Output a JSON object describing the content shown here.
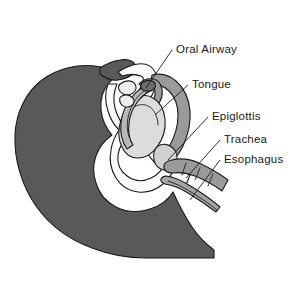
{
  "figure": {
    "background_color": "#ffffff",
    "width": 300,
    "height": 288
  },
  "palette": {
    "head_silhouette": "#595959",
    "mid_tissue": "#9a9a9a",
    "light_tissue": "#d4d4d4",
    "pale_tissue": "#e8e8e8",
    "white_tissue": "#f7f7f7",
    "outline": "#1a1a1a",
    "label_text": "#1a1a1a"
  },
  "labels": [
    {
      "id": "oral-airway",
      "text": "Oral Airway",
      "x": 176,
      "y": 53,
      "leader": {
        "x1": 172,
        "y1": 50,
        "x2": 146,
        "y2": 88
      }
    },
    {
      "id": "tongue",
      "text": "Tongue",
      "x": 192,
      "y": 88,
      "leader": {
        "x1": 188,
        "y1": 85,
        "x2": 155,
        "y2": 115
      }
    },
    {
      "id": "epiglottis",
      "text": "Epiglottis",
      "x": 212,
      "y": 120,
      "leader": {
        "x1": 208,
        "y1": 117,
        "x2": 168,
        "y2": 160
      }
    },
    {
      "id": "trachea",
      "text": "Trachea",
      "x": 224,
      "y": 143,
      "leader": {
        "x1": 220,
        "y1": 140,
        "x2": 186,
        "y2": 178
      }
    },
    {
      "id": "esophagus",
      "text": "Esophagus",
      "x": 224,
      "y": 163,
      "leader": {
        "x1": 220,
        "y1": 160,
        "x2": 190,
        "y2": 200
      }
    }
  ],
  "structures": [
    {
      "id": "head-silhouette",
      "name": "Head and neck silhouette",
      "tone": "dark-gray"
    },
    {
      "id": "face-profile",
      "name": "Face and jaw profile",
      "tone": "white"
    },
    {
      "id": "oral-airway-device",
      "name": "Oral airway device",
      "tone": "mid-gray"
    },
    {
      "id": "tongue-body",
      "name": "Tongue",
      "tone": "light-gray"
    },
    {
      "id": "soft-palate",
      "name": "Soft palate",
      "tone": "mid-gray"
    },
    {
      "id": "epiglottis-flap",
      "name": "Epiglottis",
      "tone": "light-gray"
    },
    {
      "id": "trachea-tube",
      "name": "Trachea",
      "tone": "mid-gray"
    },
    {
      "id": "esophagus-tube",
      "name": "Esophagus",
      "tone": "mid-gray"
    }
  ]
}
